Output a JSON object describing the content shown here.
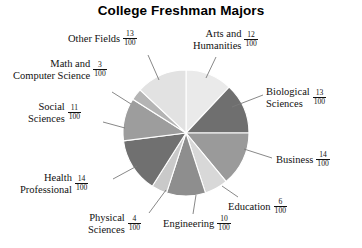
{
  "chart_data": {
    "type": "pie",
    "title": "College Freshman Majors",
    "denominator": "100",
    "units": "fraction of 100",
    "legend_position": "none",
    "labels_position": "outside-with-leader-lines",
    "start_angle_deg": 0,
    "direction": "clockwise",
    "categories": [
      "Arts and Humanities",
      "Biological Sciences",
      "Business",
      "Education",
      "Engineering",
      "Physical Sciences",
      "Health Professional",
      "Social Sciences",
      "Math and Computer Science",
      "Other Fields"
    ],
    "values": [
      12,
      13,
      14,
      6,
      10,
      4,
      14,
      11,
      3,
      13
    ],
    "total": 100,
    "slices": [
      {
        "name": "Arts and Humanities",
        "label_line1": "Arts and",
        "label_line2": "Humanities",
        "numerator": "12",
        "denominator": "100",
        "value": 12,
        "color": "#eaeaea"
      },
      {
        "name": "Biological Sciences",
        "label_line1": "Biological",
        "label_line2": "Sciences",
        "numerator": "13",
        "denominator": "100",
        "value": 13,
        "color": "#6f6f6f"
      },
      {
        "name": "Business",
        "label_line1": "Business",
        "label_line2": "",
        "numerator": "14",
        "denominator": "100",
        "value": 14,
        "color": "#9a9a9a"
      },
      {
        "name": "Education",
        "label_line1": "Education",
        "label_line2": "",
        "numerator": "6",
        "denominator": "100",
        "value": 6,
        "color": "#d8d8d8"
      },
      {
        "name": "Engineering",
        "label_line1": "Engineering",
        "label_line2": "",
        "numerator": "10",
        "denominator": "100",
        "value": 10,
        "color": "#8e8e8e"
      },
      {
        "name": "Physical Sciences",
        "label_line1": "Physical",
        "label_line2": "Sciences",
        "numerator": "4",
        "denominator": "100",
        "value": 4,
        "color": "#c9c9c9"
      },
      {
        "name": "Health Professional",
        "label_line1": "Health",
        "label_line2": "Professional",
        "numerator": "14",
        "denominator": "100",
        "value": 14,
        "color": "#707070"
      },
      {
        "name": "Social Sciences",
        "label_line1": "Social",
        "label_line2": "Sciences",
        "numerator": "11",
        "denominator": "100",
        "value": 11,
        "color": "#9d9d9d"
      },
      {
        "name": "Math and Computer Science",
        "label_line1": "Math and",
        "label_line2": "Computer Science",
        "numerator": "3",
        "denominator": "100",
        "value": 3,
        "color": "#b4b4b4"
      },
      {
        "name": "Other Fields",
        "label_line1": "Other Fields",
        "label_line2": "",
        "numerator": "13",
        "denominator": "100",
        "value": 13,
        "color": "#e2e2e2"
      }
    ],
    "geometry": {
      "center_x": 186,
      "center_y": 133,
      "radius": 63
    },
    "colors": {
      "background": "#ffffff",
      "text": "#111111",
      "leader_line": "#7a7a7a",
      "slice_outline": "#ffffff"
    }
  }
}
